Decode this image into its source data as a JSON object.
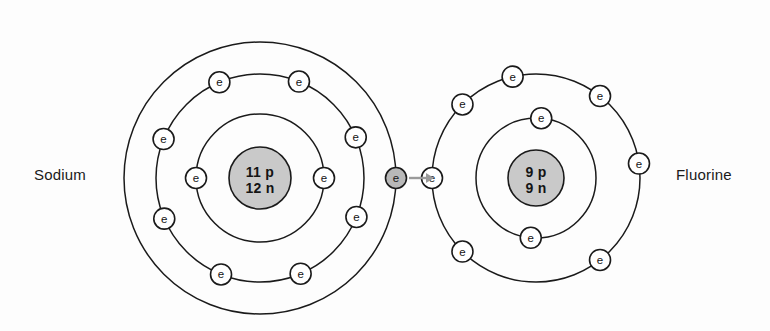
{
  "figure": {
    "type": "atomic-shell-diagram",
    "background_color": "#fdfdfd",
    "line_color": "#1a1a1a",
    "nucleus_fill": "#c9c9c9",
    "electron_fill": "#ffffff",
    "transfer_electron_fill": "#b8b8b8",
    "arrow_color": "#9a9a9a"
  },
  "atoms": [
    {
      "id": "sodium",
      "label": "Sodium",
      "label_x": 34,
      "label_y": 180,
      "center_x": 260,
      "center_y": 178,
      "nucleus": {
        "radius": 31,
        "line1": "11 p",
        "line2": "12 n"
      },
      "shells": [
        {
          "name": "shell-1",
          "radius": 64,
          "electron_count": 2,
          "electron_angles": [
            180,
            0
          ]
        },
        {
          "name": "shell-2",
          "radius": 104,
          "electron_count": 8,
          "electron_angles": [
            248,
            203,
            158,
            113,
            68,
            23,
            338,
            293
          ]
        },
        {
          "name": "shell-3",
          "radius": 136,
          "electron_count": 1,
          "electron_angles": [
            0
          ],
          "transfer": true
        }
      ]
    },
    {
      "id": "fluorine",
      "label": "Fluorine",
      "label_x": 676,
      "label_y": 180,
      "center_x": 536,
      "center_y": 178,
      "nucleus": {
        "radius": 28,
        "line1": "9 p",
        "line2": "9 n"
      },
      "shells": [
        {
          "name": "shell-1",
          "radius": 60,
          "electron_count": 2,
          "electron_angles": [
            265,
            85
          ]
        },
        {
          "name": "shell-2",
          "radius": 104,
          "electron_count": 7,
          "electron_angles": [
            225,
            180,
            135,
            103,
            52,
            8,
            308
          ]
        }
      ]
    }
  ],
  "electron_symbol": "e",
  "transfer_arrow": {
    "name": "electron-transfer-arrow",
    "x1": 409,
    "x2": 434,
    "y": 178,
    "direction": "right"
  }
}
